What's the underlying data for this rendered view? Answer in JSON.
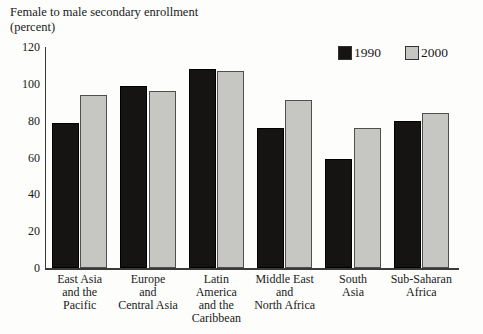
{
  "title": {
    "line1": "Female to male secondary enrollment",
    "line2": "(percent)"
  },
  "chart_data": {
    "type": "bar",
    "title": "Female to male secondary enrollment (percent)",
    "xlabel": "",
    "ylabel": "Female to male secondary enrollment (percent)",
    "ylim": [
      0,
      120
    ],
    "yticks": [
      0,
      20,
      40,
      60,
      80,
      100,
      120
    ],
    "grid": false,
    "legend_position": "top-right",
    "categories": [
      "East Asia\nand the\nPacific",
      "Europe\nand\nCentral Asia",
      "Latin\nAmerica\nand the\nCaribbean",
      "Middle East\nand\nNorth Africa",
      "South\nAsia",
      "Sub-Saharan\nAfrica"
    ],
    "series": [
      {
        "name": "1990",
        "color": "#161412",
        "values": [
          79,
          99,
          108,
          76,
          59,
          80
        ]
      },
      {
        "name": "2000",
        "color": "#c6c6c3",
        "values": [
          94,
          96,
          107,
          91,
          76,
          84
        ]
      }
    ]
  }
}
